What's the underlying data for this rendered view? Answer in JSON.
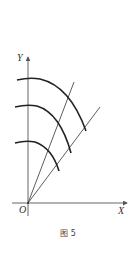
{
  "figure": {
    "caption": "图 5",
    "axis_labels": {
      "x": "X",
      "y": "Y",
      "origin": "O"
    },
    "colors": {
      "background": "#ffffff",
      "axis": "#555555",
      "arc": "#222222",
      "radial_line": "#333333",
      "text": "#333333"
    },
    "elements": {
      "axes": {
        "origin_px": [
          28,
          203
        ],
        "x_axis": {
          "from": [
            12,
            203
          ],
          "to": [
            129,
            203
          ]
        },
        "y_axis": {
          "from": [
            28,
            216
          ],
          "to": [
            28,
            55
          ]
        }
      },
      "radial_lines": [
        {
          "name": "steep",
          "from": [
            28,
            203
          ],
          "to": [
            74,
            82
          ]
        },
        {
          "name": "shallow",
          "from": [
            28,
            203
          ],
          "to": [
            100,
            107
          ]
        }
      ],
      "arcs": [
        {
          "name": "arc-outer",
          "start": [
            17,
            79
          ],
          "end": [
            86,
            131
          ]
        },
        {
          "name": "arc-middle",
          "start": [
            15,
            106
          ],
          "end": [
            71,
            153
          ]
        },
        {
          "name": "arc-inner",
          "start": [
            15,
            142
          ],
          "end": [
            59,
            171
          ]
        }
      ]
    }
  }
}
